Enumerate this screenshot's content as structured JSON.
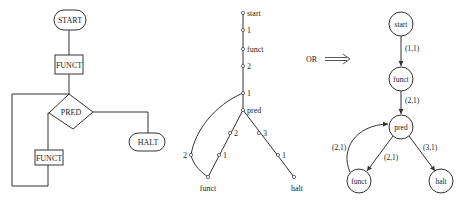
{
  "flowchart": {
    "start_label": "START",
    "funct1_label": "FUNCT",
    "pred_label": "PRED",
    "funct2_label": "FUNCT",
    "halt_label": "HALT"
  },
  "tree": {
    "nodes": {
      "start": "start",
      "a1": "1",
      "funct": "funct",
      "a2": "2",
      "b1": "1",
      "pred": "pred",
      "c2": "2",
      "c1": "1",
      "d3": "3",
      "d1": "1",
      "e2": "2",
      "funct_leaf": "funct",
      "halt_leaf": "halt"
    }
  },
  "separator": {
    "or_label": "OR",
    "arrow": "double-right-arrow"
  },
  "graph": {
    "nodes": {
      "start": "start",
      "funct_top": "funct",
      "pred": "pred",
      "funct_bottom": "funct",
      "halt": "halt"
    },
    "edges": {
      "start_funct": "(1,1)",
      "funct_pred": "(2,1)",
      "pred_funct": "(2,1)",
      "funct_pred_back": "(2,1)",
      "pred_halt": "(3,1)"
    }
  }
}
